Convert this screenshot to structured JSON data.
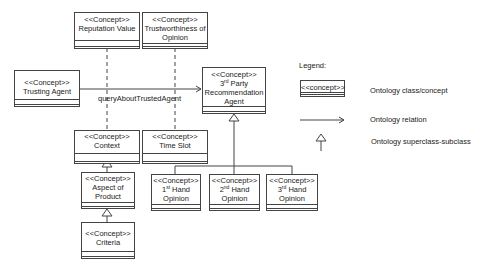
{
  "diagram": {
    "concepts": {
      "reputation_value": {
        "stereotype": "<<Concept>>",
        "name": "Reputation Value"
      },
      "trustworthiness": {
        "stereotype": "<<Concept>>",
        "name_line1": "Trustworthiness of",
        "name_line2": "Opinion"
      },
      "trusting_agent": {
        "stereotype": "<<Concept>>",
        "name": "Trusting Agent"
      },
      "third_party_agent": {
        "stereotype": "<<Concept>>",
        "name_prefix": "3",
        "name_sup": "rd",
        "name_line1_rest": " Party",
        "name_line2": "Recommendation",
        "name_line3": "Agent"
      },
      "context": {
        "stereotype": "<<Concept>>",
        "name": "Context"
      },
      "time_slot": {
        "stereotype": "<<Concept>>",
        "name": "Time Slot"
      },
      "aspect_of_product": {
        "stereotype": "<<Concept>>",
        "name_line1": "Aspect of",
        "name_line2": "Product"
      },
      "criteria": {
        "stereotype": "<<Concept>>",
        "name": "Criteria"
      },
      "first_hand": {
        "stereotype": "<<Concept>>",
        "name_prefix": "1",
        "name_sup": "st",
        "name_line1_rest": " Hand",
        "name_line2": "Opinion"
      },
      "second_hand": {
        "stereotype": "<<Concept>>",
        "name_prefix": "2",
        "name_sup": "nd",
        "name_line1_rest": " Hand",
        "name_line2": "Opinion"
      },
      "third_hand": {
        "stereotype": "<<Concept>>",
        "name_prefix": "3",
        "name_sup": "rd",
        "name_line1_rest": " Hand",
        "name_line2": "Opinion"
      }
    },
    "relation_label": "queryAboutTrustedAgent",
    "legend": {
      "title": "Legend:",
      "box_label": "<<concept>>",
      "class_desc": "Ontology class/concept",
      "relation_desc": "Ontology relation",
      "inheritance_desc": "Ontology superclass-subclass"
    }
  }
}
